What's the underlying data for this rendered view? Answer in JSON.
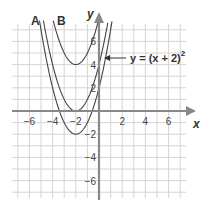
{
  "chart_data": {
    "type": "line",
    "title": "",
    "xlabel": "x",
    "ylabel": "y",
    "xlim": [
      -7.5,
      7.5
    ],
    "ylim": [
      -7.5,
      7.5
    ],
    "grid": true,
    "x_ticks": [
      -6,
      -4,
      -2,
      2,
      4,
      6
    ],
    "y_ticks": [
      6,
      4,
      2,
      -2,
      -4,
      -6
    ],
    "series": [
      {
        "name": "y = (x + 2)^2",
        "label": "",
        "vertex": [
          -2,
          0
        ],
        "formula": "(x+2)^2"
      },
      {
        "name": "A",
        "label": "A",
        "vertex": [
          -2,
          -2
        ],
        "formula": "(x+2)^2 - 2"
      },
      {
        "name": "B",
        "label": "B",
        "vertex": [
          -2,
          4
        ],
        "formula": "(x+2)^2 + 4"
      }
    ],
    "annotations": [
      {
        "text": "y = (x + 2)",
        "superscript": "2",
        "points_to": [
          0,
          4
        ]
      }
    ]
  },
  "labels": {
    "x_axis": "x",
    "y_axis": "y",
    "curve_a": "A",
    "curve_b": "B",
    "equation": "y = (x + 2)",
    "equation_exp": "2",
    "ticks_x": [
      "−6",
      "−4",
      "−2",
      "2",
      "4",
      "6"
    ],
    "ticks_y": [
      "6",
      "4",
      "2",
      "−2",
      "−4",
      "−6"
    ]
  }
}
